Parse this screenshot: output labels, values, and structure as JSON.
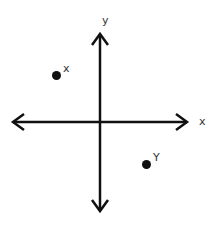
{
  "diagram": {
    "type": "coordinate-plane",
    "axes": {
      "x_label": "x",
      "y_label": "y",
      "color": "#111111"
    },
    "points": [
      {
        "label": "X",
        "display": "x",
        "quadrant": "II",
        "color": "#111111"
      },
      {
        "label": "Y",
        "display": "Y",
        "quadrant": "IV",
        "color": "#111111"
      }
    ]
  }
}
